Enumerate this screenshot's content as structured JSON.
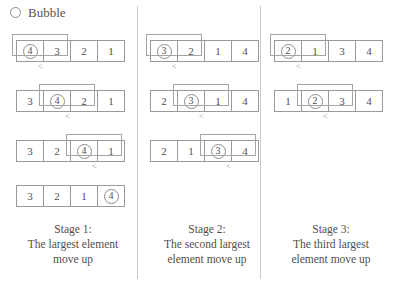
{
  "header": {
    "radio_icon": "radio-unchecked-icon",
    "label": "Bubble",
    "selected": false
  },
  "colors": {
    "box_border": "#9a9a9a",
    "bracket_border": "#a5a5a5",
    "divider": "#c9c9c9",
    "text": "#4f4f4f",
    "background": "#ffffff"
  },
  "comparison_symbol": "<",
  "stages": [
    {
      "caption_lines": [
        "Stage 1:",
        "The largest element",
        "move up"
      ],
      "rows": [
        {
          "values": [
            "4",
            "3",
            "2",
            "1"
          ],
          "circled_index": 0,
          "bracket_start": 0,
          "compare": "<"
        },
        {
          "values": [
            "3",
            "4",
            "2",
            "1"
          ],
          "circled_index": 1,
          "bracket_start": 1,
          "compare": "<"
        },
        {
          "values": [
            "3",
            "2",
            "4",
            "1"
          ],
          "circled_index": 2,
          "bracket_start": 2,
          "compare": "<"
        },
        {
          "values": [
            "3",
            "2",
            "1",
            "4"
          ],
          "circled_index": 3,
          "bracket_start": -1,
          "compare": ""
        }
      ]
    },
    {
      "caption_lines": [
        "Stage 2:",
        "The second largest",
        "element move up"
      ],
      "rows": [
        {
          "values": [
            "3",
            "2",
            "1",
            "4"
          ],
          "circled_index": 0,
          "bracket_start": 0,
          "compare": "<"
        },
        {
          "values": [
            "2",
            "3",
            "1",
            "4"
          ],
          "circled_index": 1,
          "bracket_start": 1,
          "compare": "<"
        },
        {
          "values": [
            "2",
            "1",
            "3",
            "4"
          ],
          "circled_index": 2,
          "bracket_start": 2,
          "compare": "<"
        }
      ]
    },
    {
      "caption_lines": [
        "Stage 3:",
        "The third largest",
        "element move up"
      ],
      "rows": [
        {
          "values": [
            "2",
            "1",
            "3",
            "4"
          ],
          "circled_index": 0,
          "bracket_start": 0,
          "compare": "<"
        },
        {
          "values": [
            "1",
            "2",
            "3",
            "4"
          ],
          "circled_index": 1,
          "bracket_start": 1,
          "compare": "<"
        }
      ]
    }
  ]
}
